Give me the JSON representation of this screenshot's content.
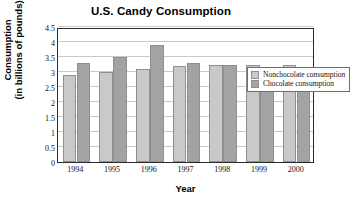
{
  "chart_data": {
    "type": "bar",
    "title": "U.S. Candy Consumption",
    "xlabel": "Year",
    "ylabel_line1": "Consumption",
    "ylabel_line2": "(in billions of pounds)",
    "categories": [
      "1994",
      "1995",
      "1996",
      "1997",
      "1998",
      "1999",
      "2000"
    ],
    "series": [
      {
        "name": "Nonchocolate consumption",
        "color": "#c9c9c9",
        "values": [
          2.9,
          3.0,
          3.1,
          3.2,
          3.25,
          3.25,
          3.25
        ]
      },
      {
        "name": "Chocolate consumption",
        "color": "#a3a3a3",
        "values": [
          3.3,
          3.5,
          3.9,
          3.3,
          3.25,
          3.15,
          3.05
        ]
      }
    ],
    "ylim": [
      0,
      4.5
    ],
    "yticks": [
      "0",
      "0.5",
      "1",
      "1.5",
      "2",
      "2.5",
      "3",
      "3.5",
      "4",
      "4.5"
    ],
    "ytick_values": [
      0,
      0.5,
      1,
      1.5,
      2,
      2.5,
      3,
      3.5,
      4,
      4.5
    ],
    "grid": true,
    "legend_position": "top-right"
  }
}
